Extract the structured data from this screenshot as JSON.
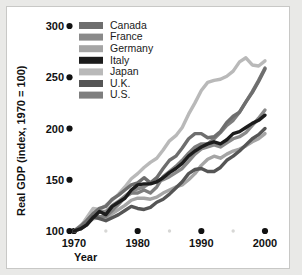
{
  "figure": {
    "background_color": "#e9e9e7",
    "plot_background_color": "#ffffff",
    "border_color": "#c8c8c6"
  },
  "chart_data": {
    "type": "line",
    "title": "",
    "xlabel": "Year",
    "ylabel": "Real GDP (index, 1970 = 100)",
    "xlim": [
      1970,
      2000
    ],
    "ylim": [
      100,
      300
    ],
    "xticks": [
      1970,
      1980,
      1990,
      2000
    ],
    "xtick_labels": [
      "1970",
      "1980",
      "1990",
      "2000"
    ],
    "yticks": [
      100,
      150,
      200,
      250,
      300
    ],
    "ytick_labels": [
      "100",
      "150",
      "200",
      "250",
      "300"
    ],
    "minor_xticks": [
      1975,
      1985,
      1995
    ],
    "grid": false,
    "legend_position": "top-left",
    "x": [
      1970,
      1971,
      1972,
      1973,
      1974,
      1975,
      1976,
      1977,
      1978,
      1979,
      1980,
      1981,
      1982,
      1983,
      1984,
      1985,
      1986,
      1987,
      1988,
      1989,
      1990,
      1991,
      1992,
      1993,
      1994,
      1995,
      1996,
      1997,
      1998,
      1999,
      2000
    ],
    "series": [
      {
        "name": "Canada",
        "color": "#6e6e6e",
        "values": [
          100,
          104,
          110,
          117,
          122,
          124,
          131,
          135,
          140,
          145,
          147,
          152,
          147,
          152,
          161,
          169,
          173,
          181,
          190,
          195,
          195,
          191,
          192,
          197,
          206,
          212,
          216,
          226,
          235,
          246,
          258
        ]
      },
      {
        "name": "France",
        "color": "#8a8a8a",
        "values": [
          100,
          105,
          110,
          116,
          119,
          119,
          125,
          129,
          134,
          139,
          141,
          143,
          147,
          148,
          150,
          153,
          157,
          161,
          168,
          175,
          180,
          182,
          184,
          182,
          186,
          190,
          192,
          196,
          203,
          210,
          218
        ]
      },
      {
        "name": "Germany",
        "color": "#a5a5a5",
        "values": [
          100,
          103,
          107,
          112,
          113,
          111,
          117,
          121,
          125,
          130,
          132,
          132,
          131,
          133,
          137,
          140,
          143,
          145,
          150,
          156,
          164,
          170,
          173,
          171,
          175,
          178,
          180,
          183,
          187,
          190,
          195
        ]
      },
      {
        "name": "Italy",
        "color": "#1c1c1c",
        "values": [
          100,
          102,
          106,
          113,
          119,
          116,
          124,
          128,
          132,
          140,
          145,
          146,
          146,
          148,
          152,
          157,
          161,
          166,
          173,
          178,
          182,
          185,
          187,
          185,
          189,
          195,
          197,
          201,
          205,
          208,
          213
        ]
      },
      {
        "name": "Japan",
        "color": "#b9b9b9",
        "values": [
          100,
          104,
          113,
          122,
          121,
          125,
          130,
          136,
          143,
          151,
          156,
          162,
          167,
          171,
          179,
          188,
          193,
          201,
          214,
          225,
          237,
          245,
          247,
          248,
          251,
          256,
          265,
          269,
          262,
          261,
          266
        ]
      },
      {
        "name": "U.K.",
        "color": "#555555",
        "values": [
          100,
          102,
          106,
          114,
          112,
          110,
          113,
          116,
          120,
          124,
          122,
          121,
          123,
          128,
          131,
          136,
          142,
          148,
          156,
          160,
          161,
          158,
          158,
          162,
          169,
          173,
          178,
          184,
          190,
          194,
          200
        ]
      },
      {
        "name": "U.S.",
        "color": "#7e7e7e",
        "values": [
          100,
          103,
          109,
          115,
          114,
          114,
          120,
          126,
          133,
          137,
          137,
          140,
          137,
          143,
          153,
          158,
          163,
          169,
          176,
          182,
          185,
          185,
          190,
          196,
          203,
          208,
          216,
          226,
          236,
          247,
          259
        ]
      }
    ]
  },
  "legend": {
    "items": [
      {
        "label": "Canada",
        "color": "#6e6e6e"
      },
      {
        "label": "France",
        "color": "#8a8a8a"
      },
      {
        "label": "Germany",
        "color": "#a5a5a5"
      },
      {
        "label": "Italy",
        "color": "#1c1c1c"
      },
      {
        "label": "Japan",
        "color": "#b9b9b9"
      },
      {
        "label": "U.K.",
        "color": "#555555"
      },
      {
        "label": "U.S.",
        "color": "#7e7e7e"
      }
    ]
  }
}
